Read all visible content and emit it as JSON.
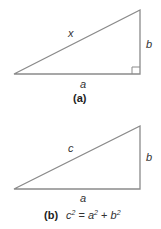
{
  "colors": {
    "stroke": "#8a8a8a",
    "text": "#333333",
    "background": "#ffffff"
  },
  "figure_a": {
    "hypotenuse_label": "x",
    "vertical_label": "b",
    "base_label": "a",
    "caption": "(a)",
    "right_angle_marker": true
  },
  "figure_b": {
    "hypotenuse_label": "c",
    "vertical_label": "b",
    "base_label": "a",
    "caption": "(b)",
    "equation": {
      "lhs_base": "c",
      "lhs_exp": "2",
      "equals": " = ",
      "term1_base": "a",
      "term1_exp": "2",
      "plus": " + ",
      "term2_base": "b",
      "term2_exp": "2"
    }
  }
}
